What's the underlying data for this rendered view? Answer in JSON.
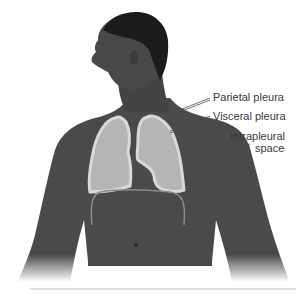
{
  "figure": {
    "labels": [
      {
        "id": "parietal",
        "text": "Parietal pleura"
      },
      {
        "id": "visceral",
        "text": "Visceral pleura"
      },
      {
        "id": "intrapleural_1",
        "text": "Intrapleural"
      },
      {
        "id": "intrapleural_2",
        "text": "space"
      }
    ],
    "colors": {
      "skin": "#4e4e4e",
      "skin_dark": "#2f2f2f",
      "hair": "#1a1a1a",
      "lung_fill": "#b5b5b5",
      "pleura_outline": "#d8d8d8",
      "label_text": "#3a3a3a",
      "leader_line": "#4a4a4a"
    }
  }
}
